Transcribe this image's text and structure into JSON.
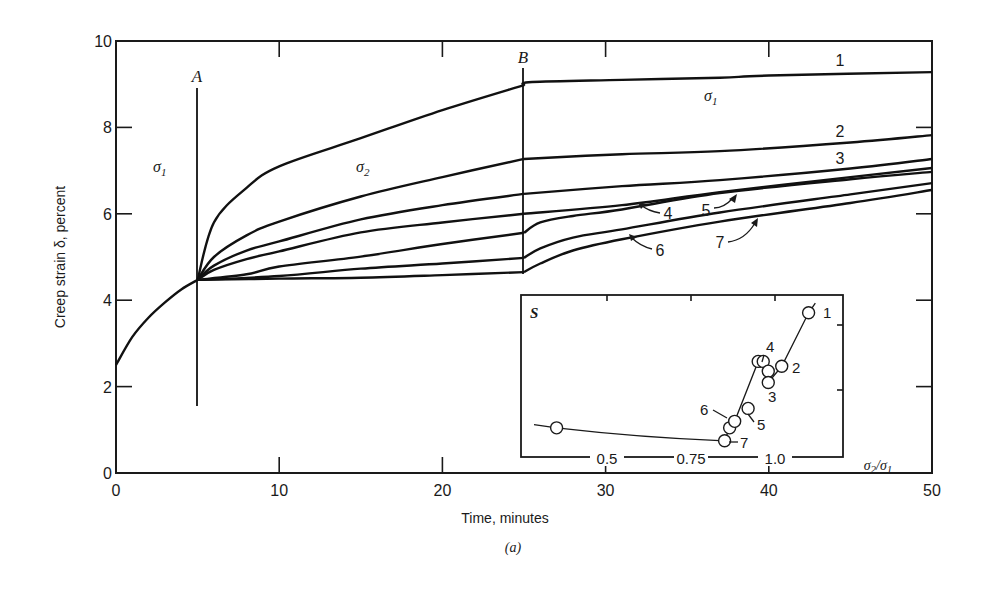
{
  "chart_data": {
    "type": "line",
    "title": "",
    "caption": "(a)",
    "xlabel": "Time, minutes",
    "ylabel": "Creep strain δ, percent",
    "xlim": [
      0,
      50
    ],
    "ylim": [
      0,
      10
    ],
    "x_ticks": [
      0,
      10,
      20,
      30,
      40,
      50
    ],
    "y_ticks": [
      0,
      2,
      4,
      6,
      8,
      10
    ],
    "grid": false,
    "legend": "none (curves numbered 1–7 directly)",
    "annotations": [
      {
        "text": "A",
        "x": 5,
        "note": "stress change from σ1 to σ2 at t=5 min"
      },
      {
        "text": "B",
        "x": 25,
        "note": "stress returned to σ1 at t=25 min"
      },
      {
        "text": "σ1",
        "region": "0–5 min"
      },
      {
        "text": "σ2",
        "region": "5–25 min"
      },
      {
        "text": "σ1",
        "region": "25–50 min"
      }
    ],
    "initial_segment": {
      "name": "common loading under σ1",
      "x": [
        0,
        1,
        2,
        3,
        4,
        5
      ],
      "y": [
        2.5,
        3.15,
        3.6,
        3.95,
        4.25,
        4.47
      ]
    },
    "series": [
      {
        "name": "1",
        "x": [
          5,
          6,
          8,
          10,
          15,
          20,
          25,
          25.5,
          31,
          37,
          40,
          50
        ],
        "y": [
          4.47,
          5.8,
          6.6,
          7.1,
          7.75,
          8.4,
          8.98,
          9.05,
          9.1,
          9.15,
          9.2,
          9.28
        ]
      },
      {
        "name": "2",
        "x": [
          5,
          6,
          8,
          10,
          15,
          20,
          25,
          31,
          37,
          45,
          50
        ],
        "y": [
          4.47,
          5.0,
          5.5,
          5.82,
          6.4,
          6.85,
          7.27,
          7.38,
          7.45,
          7.65,
          7.82
        ]
      },
      {
        "name": "3",
        "x": [
          5,
          6,
          8,
          10,
          15,
          20,
          25,
          31,
          37,
          45,
          50
        ],
        "y": [
          4.47,
          4.8,
          5.15,
          5.36,
          5.87,
          6.2,
          6.46,
          6.64,
          6.78,
          7.05,
          7.27
        ]
      },
      {
        "name": "4",
        "x": [
          5,
          6,
          8,
          10,
          15,
          20,
          25,
          31,
          37,
          45,
          50
        ],
        "y": [
          4.47,
          4.7,
          4.95,
          5.13,
          5.57,
          5.8,
          6.0,
          6.2,
          6.5,
          6.85,
          7.06
        ]
      },
      {
        "name": "5",
        "x": [
          5,
          8,
          10,
          15,
          20,
          25,
          26,
          28,
          31,
          37,
          45,
          50
        ],
        "y": [
          4.47,
          4.6,
          4.78,
          5.01,
          5.3,
          5.56,
          5.8,
          5.95,
          6.1,
          6.48,
          6.8,
          6.97
        ]
      },
      {
        "name": "6",
        "x": [
          5,
          10,
          15,
          20,
          25,
          26,
          28,
          31,
          37,
          45,
          50
        ],
        "y": [
          4.47,
          4.56,
          4.73,
          4.85,
          4.98,
          5.2,
          5.45,
          5.64,
          6.03,
          6.45,
          6.71
        ]
      },
      {
        "name": "7",
        "x": [
          5,
          10,
          15,
          20,
          25,
          26,
          28,
          31,
          37,
          45,
          50
        ],
        "y": [
          4.47,
          4.5,
          4.52,
          4.58,
          4.65,
          4.85,
          5.15,
          5.41,
          5.82,
          6.25,
          6.55
        ]
      }
    ],
    "inset": {
      "type": "scatter",
      "ylabel": "S",
      "xlabel": "σ2/σ1",
      "x_ticks": [
        0.5,
        0.75,
        1.0
      ],
      "xlim": [
        0.25,
        1.2
      ],
      "y_relative_range": [
        0,
        1
      ],
      "points": [
        {
          "label": "",
          "x": 0.35,
          "y": 0.18
        },
        {
          "label": "7",
          "x": 0.85,
          "y": 0.1
        },
        {
          "label": "6",
          "x": 0.865,
          "y": 0.18
        },
        {
          "label": "6",
          "x": 0.88,
          "y": 0.22
        },
        {
          "label": "5",
          "x": 0.92,
          "y": 0.3
        },
        {
          "label": "4",
          "x": 0.95,
          "y": 0.59
        },
        {
          "label": "4",
          "x": 0.965,
          "y": 0.59
        },
        {
          "label": "3",
          "x": 0.98,
          "y": 0.53
        },
        {
          "label": "3",
          "x": 0.98,
          "y": 0.46
        },
        {
          "label": "2",
          "x": 1.02,
          "y": 0.56
        },
        {
          "label": "1",
          "x": 1.1,
          "y": 0.89
        }
      ]
    }
  },
  "labels": {
    "ylabel": "Creep strain δ, percent",
    "xlabel": "Time, minutes",
    "caption": "(a)",
    "A": "A",
    "B": "B",
    "sigma1_left": "σ",
    "sigma1_left_sub": "1",
    "sigma2": "σ",
    "sigma2_sub": "2",
    "sigma1_right": "σ",
    "sigma1_right_sub": "1",
    "inset_title": "S",
    "inset_xlabel": "σ2/σ1",
    "inset_xlabel_main": "σ",
    "inset_xlabel_sub2": "2",
    "inset_xlabel_slash": "/σ",
    "inset_xlabel_sub1": "1",
    "curve_numbers": [
      "1",
      "2",
      "3",
      "4",
      "5",
      "6",
      "7"
    ],
    "x_tick_labels": [
      "0",
      "10",
      "20",
      "30",
      "40",
      "50"
    ],
    "y_tick_labels": [
      "0",
      "2",
      "4",
      "6",
      "8",
      "10"
    ],
    "inset_tick_labels": [
      "0.5",
      "0.75",
      "1.0"
    ]
  }
}
